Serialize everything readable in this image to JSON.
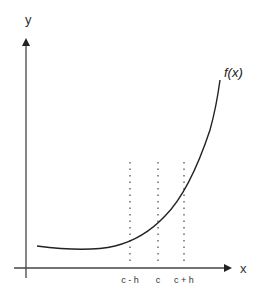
{
  "diagram": {
    "title": "",
    "axes": {
      "x_label": "x",
      "y_label": "y"
    },
    "curve": {
      "label": "f(x)",
      "description": "increasing convex (exponential-like) function"
    },
    "ticks": [
      {
        "label": "c - h",
        "x": 130
      },
      {
        "label": "c",
        "x": 158
      },
      {
        "label": "c + h",
        "x": 184
      }
    ],
    "colors": {
      "axis": "#333333",
      "curve": "#222222",
      "dotted": "#555555"
    }
  }
}
